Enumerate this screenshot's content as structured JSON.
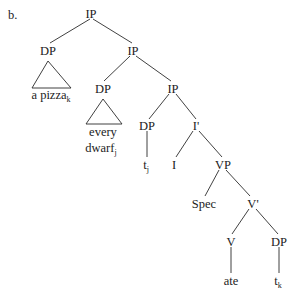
{
  "figure": {
    "item_label": "b.",
    "ink_color": "#2b2b2b",
    "text_color": "#1c1c1c",
    "background_color": "#ffffff"
  },
  "nodes": {
    "root_ip": "IP",
    "dp_pizza": "DP",
    "ip_2": "IP",
    "dp_dwarf": "DP",
    "ip_3": "IP",
    "dp_trace_j": "DP",
    "i_bar": "I'",
    "i_head": "I",
    "vp": "VP",
    "spec": "Spec",
    "v_bar": "V'",
    "v_head": "V",
    "dp_trace_k": "DP"
  },
  "leaves": {
    "pizza_text": "a pizza",
    "pizza_sub": "k",
    "dwarf_line1": "every",
    "dwarf_line2": "dwarf",
    "dwarf_sub": "j",
    "trace_j_text": "t",
    "trace_j_sub": "j",
    "verb_text": "ate",
    "trace_k_text": "t",
    "trace_k_sub": "k"
  }
}
